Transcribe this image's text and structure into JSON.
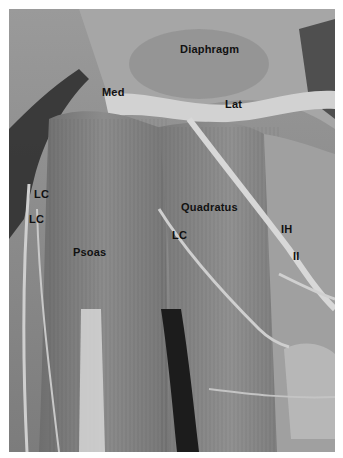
{
  "figure": {
    "type": "anatomical-dissection-photograph",
    "palette": {
      "background": "#ffffff",
      "muscle_base": "#8a8a8a",
      "tendon_light": "#cfcfcf",
      "dark_recess": "#1c1c1c",
      "label_text": "#111111"
    },
    "labels": [
      {
        "id": "diaphragm",
        "text": "Diaphragm",
        "x": 180,
        "y": 44
      },
      {
        "id": "med",
        "text": "Med",
        "x": 102,
        "y": 87
      },
      {
        "id": "lat",
        "text": "Lat",
        "x": 225,
        "y": 99
      },
      {
        "id": "lc-left-upper",
        "text": "LC",
        "x": 34,
        "y": 189
      },
      {
        "id": "lc-left-lower",
        "text": "LC",
        "x": 29,
        "y": 214
      },
      {
        "id": "quadratus",
        "text": "Quadratus",
        "x": 181,
        "y": 202
      },
      {
        "id": "lc-middle",
        "text": "LC",
        "x": 172,
        "y": 230
      },
      {
        "id": "ih",
        "text": "IH",
        "x": 281,
        "y": 224
      },
      {
        "id": "ii",
        "text": "II",
        "x": 293,
        "y": 251
      },
      {
        "id": "psoas",
        "text": "Psoas",
        "x": 73,
        "y": 247
      }
    ]
  }
}
